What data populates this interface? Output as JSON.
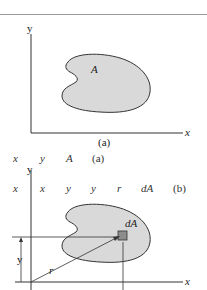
{
  "figure_a": {
    "y_axis_label": "y",
    "x_axis_label": "x",
    "region_label": "A",
    "caption": "(a)"
  },
  "overlay_row_1": {
    "items": [
      "x",
      "y",
      "A",
      "(a)"
    ]
  },
  "overlay_row_2": {
    "items": [
      "x",
      "x",
      "y",
      "y",
      "r",
      "dA",
      "(b)"
    ]
  },
  "figure_b": {
    "y_axis_label": "y",
    "x_axis_label": "x",
    "element_label": "dA",
    "distance_y_label": "y",
    "radius_label": "r"
  },
  "colors": {
    "region_fill": "#d9d9d9",
    "region_stroke": "#333333",
    "element_fill": "#8c8c8c",
    "axis": "#333333",
    "rule": "#9a9a9a"
  }
}
